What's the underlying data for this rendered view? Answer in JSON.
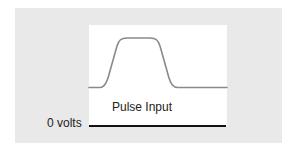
{
  "diagram": {
    "title": "Pulse Input",
    "pulse_label": "Pulse Input",
    "baseline_label": "0 volts",
    "colors": {
      "panel_background": "#e9e9e9",
      "plot_background": "#ffffff",
      "pulse_curve": "#8a8a8a",
      "baseline": "#111111",
      "text": "#222222"
    },
    "pulse_shape": {
      "type": "trapezoidal pulse with rounded corners",
      "low_level_y": 87,
      "high_level_y": 38,
      "rise_start_x": 103,
      "rise_end_x": 126,
      "fall_start_x": 152,
      "fall_end_x": 176
    },
    "baseline": {
      "y": 126,
      "x_start": 89,
      "x_end": 226
    }
  }
}
